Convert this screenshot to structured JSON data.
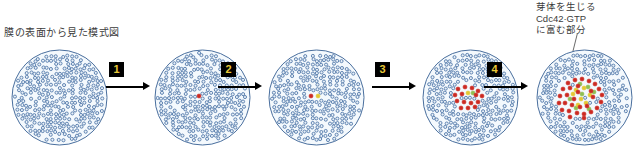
{
  "figure": {
    "caption_left": "膜の表面から見た模式図",
    "annotation_right": {
      "line1": "芽体を生じる",
      "line2": "Cdc42·GTP",
      "line3": "に富む部分"
    }
  },
  "colors": {
    "dot_blue_stroke": "#5b7fae",
    "dot_blue_fill": "#e8f0f8",
    "dot_red": "#cc2a22",
    "dot_yellow": "#e3c832",
    "dot_green": "#8fbf52",
    "circle_stroke": "#4a6f9e",
    "circle_fill": "#f4f9fd",
    "arrow_box_bg": "#000000",
    "arrow_box_text": "#e8c838",
    "arrow_line": "#000000",
    "text": "#3b3b3b"
  },
  "arrows": [
    {
      "label": "1",
      "left": 106,
      "width": 44
    },
    {
      "label": "2",
      "left": 218,
      "width": 44
    },
    {
      "label": "3",
      "left": 372,
      "width": 44
    },
    {
      "label": "4",
      "left": 484,
      "width": 44
    }
  ],
  "cells": [
    {
      "name": "cell-stage-1",
      "left": 9,
      "red_dots": [],
      "yellow_dots": [],
      "green_dots": []
    },
    {
      "name": "cell-stage-2",
      "left": 152,
      "red_dots": [
        [
          47,
          49
        ]
      ],
      "yellow_dots": [],
      "green_dots": []
    },
    {
      "name": "cell-stage-3",
      "left": 266,
      "red_dots": [
        [
          45,
          49
        ]
      ],
      "yellow_dots": [
        [
          52,
          49
        ]
      ],
      "green_dots": []
    },
    {
      "name": "cell-stage-4",
      "left": 420,
      "red_dots": [
        [
          38,
          42
        ],
        [
          45,
          40
        ],
        [
          52,
          41
        ],
        [
          58,
          44
        ],
        [
          35,
          48
        ],
        [
          42,
          47
        ],
        [
          56,
          48
        ],
        [
          62,
          49
        ],
        [
          37,
          54
        ],
        [
          44,
          55
        ],
        [
          51,
          56
        ],
        [
          58,
          55
        ],
        [
          41,
          61
        ],
        [
          48,
          61
        ],
        [
          55,
          60
        ]
      ],
      "yellow_dots": [
        [
          48,
          46
        ]
      ],
      "green_dots": [
        [
          53,
          46
        ]
      ]
    },
    {
      "name": "cell-stage-5",
      "left": 534,
      "red_dots": [
        [
          34,
          36
        ],
        [
          41,
          33
        ],
        [
          48,
          32
        ],
        [
          55,
          34
        ],
        [
          61,
          37
        ],
        [
          29,
          42
        ],
        [
          36,
          41
        ],
        [
          44,
          39
        ],
        [
          65,
          42
        ],
        [
          26,
          49
        ],
        [
          33,
          48
        ],
        [
          68,
          48
        ],
        [
          25,
          56
        ],
        [
          31,
          56
        ],
        [
          38,
          58
        ],
        [
          67,
          55
        ],
        [
          28,
          63
        ],
        [
          35,
          64
        ],
        [
          43,
          66
        ],
        [
          50,
          67
        ],
        [
          57,
          65
        ],
        [
          63,
          61
        ],
        [
          46,
          60
        ],
        [
          53,
          59
        ],
        [
          40,
          52
        ],
        [
          59,
          50
        ],
        [
          44,
          45
        ],
        [
          57,
          44
        ],
        [
          50,
          71
        ],
        [
          36,
          70
        ]
      ],
      "yellow_dots": [
        [
          42,
          43
        ],
        [
          50,
          41
        ],
        [
          56,
          48
        ],
        [
          47,
          52
        ],
        [
          39,
          47
        ],
        [
          52,
          56
        ],
        [
          44,
          58
        ]
      ],
      "green_dots": [
        [
          46,
          37
        ],
        [
          54,
          40
        ],
        [
          60,
          45
        ],
        [
          36,
          52
        ],
        [
          48,
          47
        ],
        [
          42,
          61
        ],
        [
          55,
          62
        ]
      ]
    }
  ]
}
